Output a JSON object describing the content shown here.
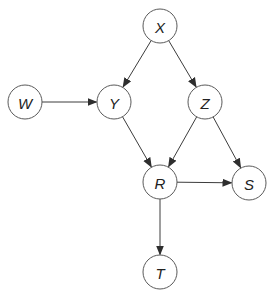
{
  "diagram": {
    "type": "directed-acyclic-graph",
    "colors": {
      "node_stroke": "#5a5a5a",
      "node_fill": "#ffffff",
      "edge": "#3c3c3c",
      "label": "#222222"
    },
    "node_radius": 17,
    "nodes": [
      {
        "id": "X",
        "label": "X",
        "cx": 160,
        "cy": 26
      },
      {
        "id": "W",
        "label": "W",
        "cx": 25,
        "cy": 102
      },
      {
        "id": "Y",
        "label": "Y",
        "cx": 114,
        "cy": 102
      },
      {
        "id": "Z",
        "label": "Z",
        "cx": 205,
        "cy": 102
      },
      {
        "id": "R",
        "label": "R",
        "cx": 160,
        "cy": 182
      },
      {
        "id": "S",
        "label": "S",
        "cx": 249,
        "cy": 183
      },
      {
        "id": "T",
        "label": "T",
        "cx": 160,
        "cy": 272
      }
    ],
    "edges": [
      {
        "from": "X",
        "to": "Y"
      },
      {
        "from": "X",
        "to": "Z"
      },
      {
        "from": "W",
        "to": "Y"
      },
      {
        "from": "Y",
        "to": "R"
      },
      {
        "from": "Z",
        "to": "R"
      },
      {
        "from": "Z",
        "to": "S"
      },
      {
        "from": "R",
        "to": "S"
      },
      {
        "from": "R",
        "to": "T"
      }
    ]
  }
}
